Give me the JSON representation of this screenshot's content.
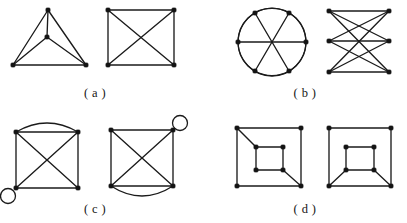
{
  "figure": {
    "background_color": "#ffffff",
    "ink_color": "#1b1b1b",
    "vertex_color": "#141414",
    "width": 407,
    "height": 223,
    "caption_style": "parenthesized-letter"
  },
  "panels": [
    {
      "id": "a",
      "label": "( a )",
      "label_x": 95,
      "label_y": 86,
      "description": "two drawings of the complete graph K4",
      "graphs": [
        {
          "id": "a-left",
          "name": "k4-triangle-with-center",
          "origin_x": 8,
          "origin_y": 4,
          "width": 88,
          "height": 74,
          "vertices": [
            {
              "id": "apex",
              "x": 40,
              "y": 6
            },
            {
              "id": "center",
              "x": 39,
              "y": 33
            },
            {
              "id": "bottom-left",
              "x": 5,
              "y": 61
            },
            {
              "id": "bottom-right",
              "x": 78,
              "y": 61
            }
          ],
          "edges": [
            {
              "from": "apex",
              "to": "center"
            },
            {
              "from": "apex",
              "to": "bottom-left"
            },
            {
              "from": "apex",
              "to": "bottom-right"
            },
            {
              "from": "center",
              "to": "bottom-left"
            },
            {
              "from": "center",
              "to": "bottom-right"
            },
            {
              "from": "bottom-left",
              "to": "bottom-right"
            }
          ],
          "loops": [],
          "multi_edges": [],
          "circles": []
        },
        {
          "id": "a-right",
          "name": "k4-square-with-diagonals",
          "origin_x": 104,
          "origin_y": 4,
          "width": 76,
          "height": 74,
          "vertices": [
            {
              "id": "top-left",
              "x": 4,
              "y": 6
            },
            {
              "id": "top-right",
              "x": 70,
              "y": 6
            },
            {
              "id": "bottom-left",
              "x": 4,
              "y": 61
            },
            {
              "id": "bottom-right",
              "x": 70,
              "y": 61
            }
          ],
          "edges": [
            {
              "from": "top-left",
              "to": "top-right"
            },
            {
              "from": "top-right",
              "to": "bottom-right"
            },
            {
              "from": "bottom-right",
              "to": "bottom-left"
            },
            {
              "from": "bottom-left",
              "to": "top-left"
            },
            {
              "from": "top-left",
              "to": "bottom-right"
            },
            {
              "from": "top-right",
              "to": "bottom-left"
            }
          ],
          "loops": [],
          "multi_edges": [],
          "circles": []
        }
      ]
    },
    {
      "id": "b",
      "label": "( b )",
      "label_x": 305,
      "label_y": 86,
      "description": "two drawings of the complete bipartite graph K3,3",
      "graphs": [
        {
          "id": "b-left",
          "name": "k33-on-a-circle",
          "origin_x": 236,
          "origin_y": 6,
          "width": 74,
          "height": 74,
          "circles": [
            {
              "id": "outer-circle",
              "cx": 36,
              "cy": 36,
              "r": 34
            }
          ],
          "vertices": [
            {
              "id": "v1",
              "x": 19,
              "y": 7
            },
            {
              "id": "v2",
              "x": 53,
              "y": 7
            },
            {
              "id": "v3",
              "x": 70,
              "y": 36
            },
            {
              "id": "v4",
              "x": 53,
              "y": 65
            },
            {
              "id": "v5",
              "x": 19,
              "y": 65
            },
            {
              "id": "v6",
              "x": 2,
              "y": 36
            }
          ],
          "edges": [
            {
              "from": "v1",
              "to": "v4"
            },
            {
              "from": "v2",
              "to": "v5"
            },
            {
              "from": "v3",
              "to": "v6"
            },
            {
              "from": "v1",
              "to": "v2",
              "arc": true
            },
            {
              "from": "v2",
              "to": "v3",
              "arc": true
            },
            {
              "from": "v3",
              "to": "v4",
              "arc": true
            },
            {
              "from": "v4",
              "to": "v5",
              "arc": true
            },
            {
              "from": "v5",
              "to": "v6",
              "arc": true
            },
            {
              "from": "v6",
              "to": "v1",
              "arc": true
            }
          ],
          "loops": [],
          "multi_edges": []
        },
        {
          "id": "b-right",
          "name": "k33-two-columns",
          "origin_x": 325,
          "origin_y": 6,
          "width": 70,
          "height": 74,
          "vertices": [
            {
              "id": "l1",
              "x": 4,
              "y": 5
            },
            {
              "id": "l2",
              "x": 4,
              "y": 35
            },
            {
              "id": "l3",
              "x": 4,
              "y": 66
            },
            {
              "id": "r1",
              "x": 64,
              "y": 5
            },
            {
              "id": "r2",
              "x": 64,
              "y": 35
            },
            {
              "id": "r3",
              "x": 64,
              "y": 66
            }
          ],
          "edges": [
            {
              "from": "l1",
              "to": "r1"
            },
            {
              "from": "l1",
              "to": "r2"
            },
            {
              "from": "l1",
              "to": "r3"
            },
            {
              "from": "l2",
              "to": "r1"
            },
            {
              "from": "l2",
              "to": "r2"
            },
            {
              "from": "l2",
              "to": "r3"
            },
            {
              "from": "l3",
              "to": "r1"
            },
            {
              "from": "l3",
              "to": "r2"
            },
            {
              "from": "l3",
              "to": "r3"
            }
          ],
          "loops": [],
          "multi_edges": [],
          "circles": []
        }
      ]
    },
    {
      "id": "c",
      "label": "( c )",
      "label_x": 95,
      "label_y": 202,
      "description": "two isomorphic multigraphs each with one loop and one double edge",
      "graphs": [
        {
          "id": "c-left",
          "name": "multigraph-loop-bottom-left",
          "origin_x": 12,
          "origin_y": 120,
          "width": 78,
          "height": 80,
          "vertices": [
            {
              "id": "top-left",
              "x": 4,
              "y": 12
            },
            {
              "id": "top-right",
              "x": 66,
              "y": 12
            },
            {
              "id": "bottom-left",
              "x": 4,
              "y": 68
            },
            {
              "id": "bottom-right",
              "x": 66,
              "y": 68
            }
          ],
          "edges": [
            {
              "from": "top-left",
              "to": "top-right"
            },
            {
              "from": "top-right",
              "to": "bottom-right"
            },
            {
              "from": "bottom-right",
              "to": "bottom-left"
            },
            {
              "from": "bottom-left",
              "to": "top-left"
            },
            {
              "from": "top-left",
              "to": "bottom-right"
            },
            {
              "from": "top-right",
              "to": "bottom-left"
            }
          ],
          "multi_edges": [
            {
              "from": "top-left",
              "to": "top-right",
              "bulge": -9,
              "note": "double edge bowing upward"
            }
          ],
          "loops": [
            {
              "at": "bottom-left",
              "cx": -4,
              "cy": 76,
              "r": 7.5,
              "note": "loop hanging below-left"
            }
          ],
          "circles": []
        },
        {
          "id": "c-right",
          "name": "multigraph-loop-top-right",
          "origin_x": 105,
          "origin_y": 116,
          "width": 80,
          "height": 82,
          "vertices": [
            {
              "id": "top-left",
              "x": 6,
              "y": 14
            },
            {
              "id": "top-right",
              "x": 68,
              "y": 14
            },
            {
              "id": "bottom-left",
              "x": 6,
              "y": 70
            },
            {
              "id": "bottom-right",
              "x": 68,
              "y": 70
            }
          ],
          "edges": [
            {
              "from": "top-left",
              "to": "top-right"
            },
            {
              "from": "top-right",
              "to": "bottom-right"
            },
            {
              "from": "bottom-right",
              "to": "bottom-left"
            },
            {
              "from": "bottom-left",
              "to": "top-left"
            },
            {
              "from": "top-left",
              "to": "bottom-right"
            },
            {
              "from": "top-right",
              "to": "bottom-left"
            }
          ],
          "multi_edges": [
            {
              "from": "bottom-left",
              "to": "bottom-right",
              "bulge": 10,
              "note": "double edge bowing downward"
            }
          ],
          "loops": [
            {
              "at": "top-right",
              "cx": 75,
              "cy": 7,
              "r": 7.5,
              "note": "loop above-right"
            }
          ],
          "circles": []
        }
      ]
    },
    {
      "id": "d",
      "label": "( d )",
      "label_x": 305,
      "label_y": 202,
      "description": "two nested-square graphs with two connecting spokes each",
      "graphs": [
        {
          "id": "d-left",
          "name": "nested-squares-diagonal-spokes",
          "origin_x": 233,
          "origin_y": 122,
          "width": 76,
          "height": 72,
          "vertices": [
            {
              "id": "o-tl",
              "x": 4,
              "y": 6
            },
            {
              "id": "o-tr",
              "x": 68,
              "y": 6
            },
            {
              "id": "o-bl",
              "x": 4,
              "y": 64
            },
            {
              "id": "o-br",
              "x": 68,
              "y": 64
            },
            {
              "id": "i-tl",
              "x": 23,
              "y": 25
            },
            {
              "id": "i-tr",
              "x": 50,
              "y": 25
            },
            {
              "id": "i-bl",
              "x": 23,
              "y": 48
            },
            {
              "id": "i-br",
              "x": 50,
              "y": 48
            }
          ],
          "edges": [
            {
              "from": "o-tl",
              "to": "o-tr"
            },
            {
              "from": "o-tr",
              "to": "o-br"
            },
            {
              "from": "o-br",
              "to": "o-bl"
            },
            {
              "from": "o-bl",
              "to": "o-tl"
            },
            {
              "from": "i-tl",
              "to": "i-tr"
            },
            {
              "from": "i-tr",
              "to": "i-br"
            },
            {
              "from": "i-br",
              "to": "i-bl"
            },
            {
              "from": "i-bl",
              "to": "i-tl"
            },
            {
              "from": "o-tl",
              "to": "i-tl"
            },
            {
              "from": "o-br",
              "to": "i-br"
            }
          ],
          "loops": [],
          "multi_edges": [],
          "circles": []
        },
        {
          "id": "d-right",
          "name": "nested-squares-bottom-spokes",
          "origin_x": 325,
          "origin_y": 122,
          "width": 74,
          "height": 72,
          "vertices": [
            {
              "id": "o-tl",
              "x": 4,
              "y": 6
            },
            {
              "id": "o-tr",
              "x": 66,
              "y": 6
            },
            {
              "id": "o-bl",
              "x": 4,
              "y": 64
            },
            {
              "id": "o-br",
              "x": 66,
              "y": 64
            },
            {
              "id": "i-tl",
              "x": 21,
              "y": 25
            },
            {
              "id": "i-tr",
              "x": 49,
              "y": 25
            },
            {
              "id": "i-bl",
              "x": 21,
              "y": 48
            },
            {
              "id": "i-br",
              "x": 49,
              "y": 48
            }
          ],
          "edges": [
            {
              "from": "o-tl",
              "to": "o-tr"
            },
            {
              "from": "o-tr",
              "to": "o-br"
            },
            {
              "from": "o-br",
              "to": "o-bl"
            },
            {
              "from": "o-bl",
              "to": "o-tl"
            },
            {
              "from": "i-tl",
              "to": "i-tr"
            },
            {
              "from": "i-tr",
              "to": "i-br"
            },
            {
              "from": "i-br",
              "to": "i-bl"
            },
            {
              "from": "i-bl",
              "to": "i-tl"
            },
            {
              "from": "o-bl",
              "to": "i-bl"
            },
            {
              "from": "o-br",
              "to": "i-br"
            }
          ],
          "loops": [],
          "multi_edges": [],
          "circles": []
        }
      ]
    }
  ]
}
